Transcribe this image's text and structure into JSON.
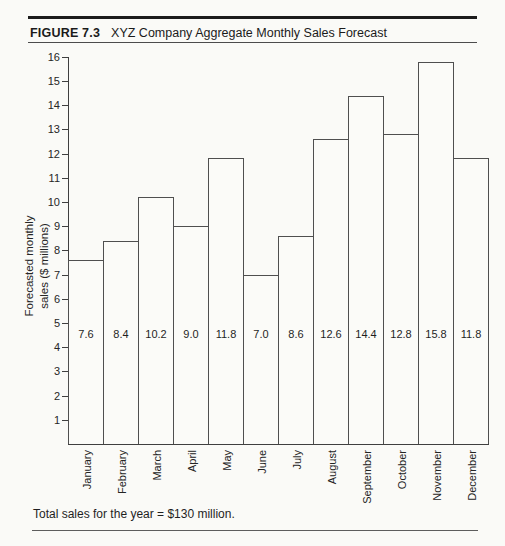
{
  "header": {
    "figure_label": "FIGURE 7.3",
    "figure_title": "XYZ Company Aggregate Monthly Sales Forecast"
  },
  "chart_data": {
    "type": "bar",
    "title": "XYZ Company Aggregate Monthly Sales Forecast",
    "categories": [
      "January",
      "February",
      "March",
      "April",
      "May",
      "June",
      "July",
      "August",
      "September",
      "October",
      "November",
      "December"
    ],
    "values": [
      7.6,
      8.4,
      10.2,
      9.0,
      11.8,
      7.0,
      8.6,
      12.6,
      14.4,
      12.8,
      15.8,
      11.8
    ],
    "bar_value_labels": [
      "7.6",
      "8.4",
      "10.2",
      "9.0",
      "11.8",
      "7.0",
      "8.6",
      "12.6",
      "14.4",
      "12.8",
      "15.8",
      "11.8"
    ],
    "ylabel_line1": "Forecasted monthly",
    "ylabel_line2": "sales ($ millions)",
    "xlabel": "",
    "ylim": [
      0,
      16
    ],
    "yticks": [
      1,
      2,
      3,
      4,
      5,
      6,
      7,
      8,
      9,
      10,
      11,
      12,
      13,
      14,
      15,
      16
    ],
    "grid": false,
    "legend": false,
    "bar_fill": "#fbfbf8",
    "bar_outline": "#4f4f4f"
  },
  "footer": {
    "total_note": "Total sales for the year = $130 million."
  },
  "colors": {
    "background": "#fafaf7",
    "line": "#3f3f3f",
    "text": "#222222",
    "rule_heavy": "#1c1c1c",
    "rule_light": "#5d5d5d"
  }
}
